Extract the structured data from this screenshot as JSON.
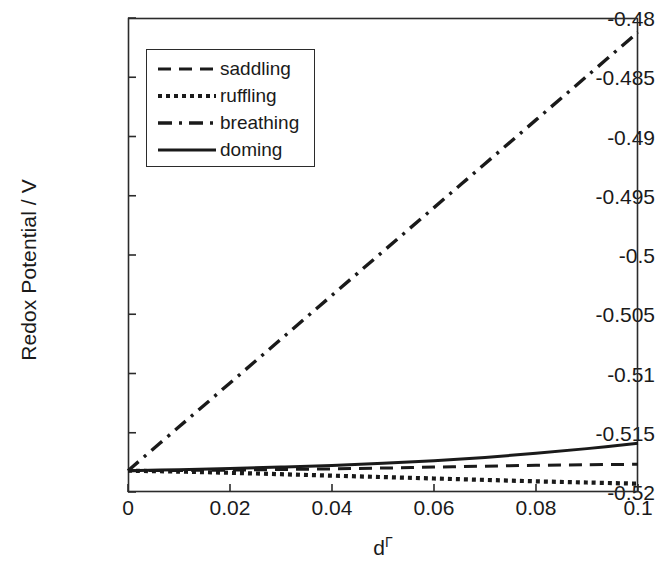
{
  "chart_data": {
    "type": "line",
    "title": "",
    "xlabel": "d",
    "xlabel_superscript": "Γ",
    "ylabel": "Redox Potential / V",
    "xlim": [
      0,
      0.1
    ],
    "ylim": [
      -0.52,
      -0.48
    ],
    "xticks": [
      "0",
      "0.02",
      "0.04",
      "0.06",
      "0.08",
      "0.1"
    ],
    "xtick_values": [
      0,
      0.02,
      0.04,
      0.06,
      0.08,
      0.1
    ],
    "yticks": [
      "-0.48",
      "-0.485",
      "-0.49",
      "-0.495",
      "-0.5",
      "-0.505",
      "-0.51",
      "-0.515",
      "-0.52"
    ],
    "ytick_values": [
      -0.48,
      -0.485,
      -0.49,
      -0.495,
      -0.5,
      -0.505,
      -0.51,
      -0.515,
      -0.52
    ],
    "grid": false,
    "legend_position": "upper left",
    "line_color": "#1a1a1a",
    "axis_color": "#2b2b2b",
    "x": [
      0,
      0.01,
      0.02,
      0.03,
      0.04,
      0.05,
      0.06,
      0.07,
      0.08,
      0.09,
      0.1
    ],
    "series": [
      {
        "name": "saddling",
        "style": "dashed",
        "values": [
          -0.5182,
          -0.51818,
          -0.51815,
          -0.5181,
          -0.51805,
          -0.51798,
          -0.5179,
          -0.51782,
          -0.51775,
          -0.5177,
          -0.51766
        ]
      },
      {
        "name": "ruffling",
        "style": "dotted",
        "values": [
          -0.5182,
          -0.51828,
          -0.51838,
          -0.5185,
          -0.51862,
          -0.51874,
          -0.51886,
          -0.51898,
          -0.5191,
          -0.5192,
          -0.5193
        ]
      },
      {
        "name": "breathing",
        "style": "dash-dot",
        "values": [
          -0.5182,
          -0.5145,
          -0.5108,
          -0.5071,
          -0.5034,
          -0.4997,
          -0.496,
          -0.4923,
          -0.4886,
          -0.4849,
          -0.4812
        ]
      },
      {
        "name": "doming",
        "style": "solid",
        "values": [
          -0.5182,
          -0.51812,
          -0.51802,
          -0.5179,
          -0.51776,
          -0.51758,
          -0.51736,
          -0.51708,
          -0.51674,
          -0.51634,
          -0.51588
        ]
      }
    ]
  },
  "legend": {
    "items": [
      {
        "label": "saddling",
        "style": "dashed"
      },
      {
        "label": "ruffling",
        "style": "dotted"
      },
      {
        "label": "breathing",
        "style": "dash-dot"
      },
      {
        "label": "doming",
        "style": "solid"
      }
    ]
  }
}
